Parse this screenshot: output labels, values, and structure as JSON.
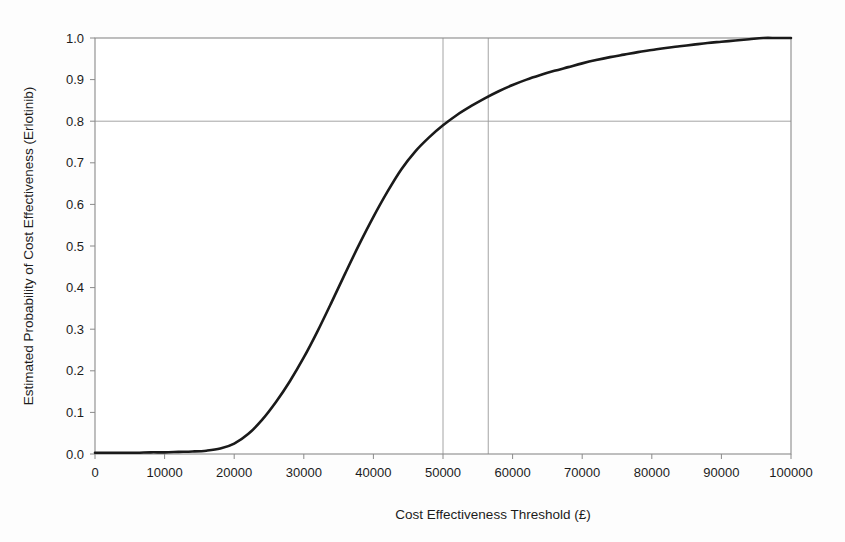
{
  "figure": {
    "background_color": "#fdfdfd",
    "plot_background_color": "#ffffff",
    "frame_color": "#8a8a8a",
    "curve_color": "#1a1a1a",
    "reference_line_color": "#9a9a9a",
    "text_color": "#1c1c1c"
  },
  "chart_data": {
    "type": "line",
    "title": "",
    "subtitle": "",
    "xlabel": "Cost Effectiveness Threshold (£)",
    "ylabel": "Estimated Probability of Cost Effectiveness (Erlotinib)",
    "xlim": [
      0,
      100000
    ],
    "ylim": [
      0.0,
      1.0
    ],
    "xticks": [
      0,
      10000,
      20000,
      30000,
      40000,
      50000,
      60000,
      70000,
      80000,
      90000,
      100000
    ],
    "xticklabels": [
      "0",
      "10000",
      "20000",
      "30000",
      "40000",
      "50000",
      "60000",
      "70000",
      "80000",
      "90000",
      "100000"
    ],
    "yticks": [
      0.0,
      0.1,
      0.2,
      0.3,
      0.4,
      0.5,
      0.6,
      0.7,
      0.8,
      0.9,
      1.0
    ],
    "yticklabels": [
      "0.0",
      "0.1",
      "0.2",
      "0.3",
      "0.4",
      "0.5",
      "0.6",
      "0.7",
      "0.8",
      "0.9",
      "1.0"
    ],
    "grid": false,
    "legend": null,
    "legend_position": "none",
    "series": [
      {
        "name": "Erlotinib cost effectiveness acceptability curve",
        "x": [
          0,
          2000,
          4000,
          6000,
          8000,
          10000,
          12000,
          14000,
          16000,
          18000,
          20000,
          22000,
          24000,
          26000,
          28000,
          30000,
          32000,
          34000,
          36000,
          38000,
          40000,
          42000,
          44000,
          46000,
          48000,
          50000,
          52000,
          54000,
          56000,
          58000,
          60000,
          62000,
          64000,
          66000,
          68000,
          70000,
          72000,
          74000,
          76000,
          78000,
          80000,
          82000,
          84000,
          86000,
          88000,
          90000,
          92000,
          94000,
          96000,
          98000,
          100000
        ],
        "y": [
          0.003,
          0.003,
          0.003,
          0.003,
          0.004,
          0.004,
          0.005,
          0.006,
          0.008,
          0.013,
          0.025,
          0.048,
          0.082,
          0.125,
          0.175,
          0.232,
          0.296,
          0.365,
          0.436,
          0.505,
          0.57,
          0.63,
          0.684,
          0.727,
          0.761,
          0.79,
          0.815,
          0.836,
          0.855,
          0.872,
          0.887,
          0.9,
          0.911,
          0.921,
          0.93,
          0.939,
          0.947,
          0.954,
          0.96,
          0.966,
          0.971,
          0.976,
          0.98,
          0.984,
          0.988,
          0.991,
          0.994,
          0.997,
          1.0,
          1.0,
          1.0
        ]
      }
    ],
    "reference_lines": [
      {
        "orientation": "vertical",
        "value": 50000,
        "label": "50000"
      },
      {
        "orientation": "vertical",
        "value": 56500,
        "label": "56500"
      },
      {
        "orientation": "horizontal",
        "value": 0.8,
        "label": "0.8"
      }
    ],
    "annotations": []
  }
}
